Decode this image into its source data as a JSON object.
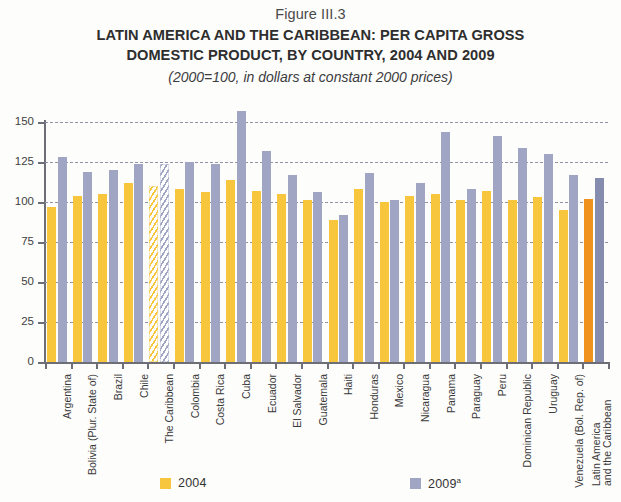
{
  "figure": {
    "number": "Figure III.3",
    "title_line1": "LATIN AMERICA AND THE CARIBBEAN: PER CAPITA GROSS",
    "title_line2": "DOMESTIC PRODUCT, BY COUNTRY, 2004 AND 2009",
    "subtitle": "(2000=100, in dollars at constant 2000 prices)"
  },
  "legend": {
    "item1_label": "2004",
    "item2_label": "2009",
    "item2_superscript": "a",
    "color_2004": "#f8c63c",
    "color_2009": "#a0a5c4"
  },
  "chart_data": {
    "type": "bar",
    "title": "LATIN AMERICA AND THE CARIBBEAN: PER CAPITA GROSS DOMESTIC PRODUCT, BY COUNTRY, 2004 AND 2009",
    "subtitle": "(2000=100, in dollars at constant 2000 prices)",
    "xlabel": "",
    "ylabel": "",
    "ylim": [
      0,
      150
    ],
    "yticks": [
      0,
      25,
      50,
      75,
      100,
      125,
      150
    ],
    "ytick_labels": [
      "0",
      "25",
      "50",
      "75",
      "100",
      "125",
      "150"
    ],
    "grid": true,
    "legend_position": "bottom",
    "categories": [
      "Argentina",
      "Bolivia (Plur. State of)",
      "Brazil",
      "Chile",
      "The Caribbean",
      "Colombia",
      "Costa Rica",
      "Cuba",
      "Ecuador",
      "El Salvador",
      "Guatemala",
      "Haiti",
      "Honduras",
      "Mexico",
      "Nicaragua",
      "Panama",
      "Paraguay",
      "Peru",
      "Dominican Republic",
      "Uruguay",
      "Venezuela (Bol. Rep. of)",
      "Latin America and the Caribbean"
    ],
    "series": [
      {
        "name": "2004",
        "color": "#f8c63c",
        "values": [
          97,
          104,
          105,
          112,
          110,
          108,
          106,
          114,
          107,
          105,
          101,
          89,
          108,
          100,
          104,
          105,
          101,
          107,
          101,
          103,
          95,
          102
        ]
      },
      {
        "name": "2009",
        "color": "#a0a5c4",
        "values": [
          128,
          119,
          120,
          124,
          124,
          125,
          124,
          157,
          132,
          117,
          106,
          92,
          118,
          101,
          112,
          144,
          108,
          141,
          134,
          130,
          117,
          115
        ]
      }
    ],
    "special_styles": {
      "hatched_category": "The Caribbean",
      "accent_category": "Latin America and the Caribbean",
      "accent_color_2004": "#f0921e",
      "accent_color_2009": "#868cae"
    }
  }
}
